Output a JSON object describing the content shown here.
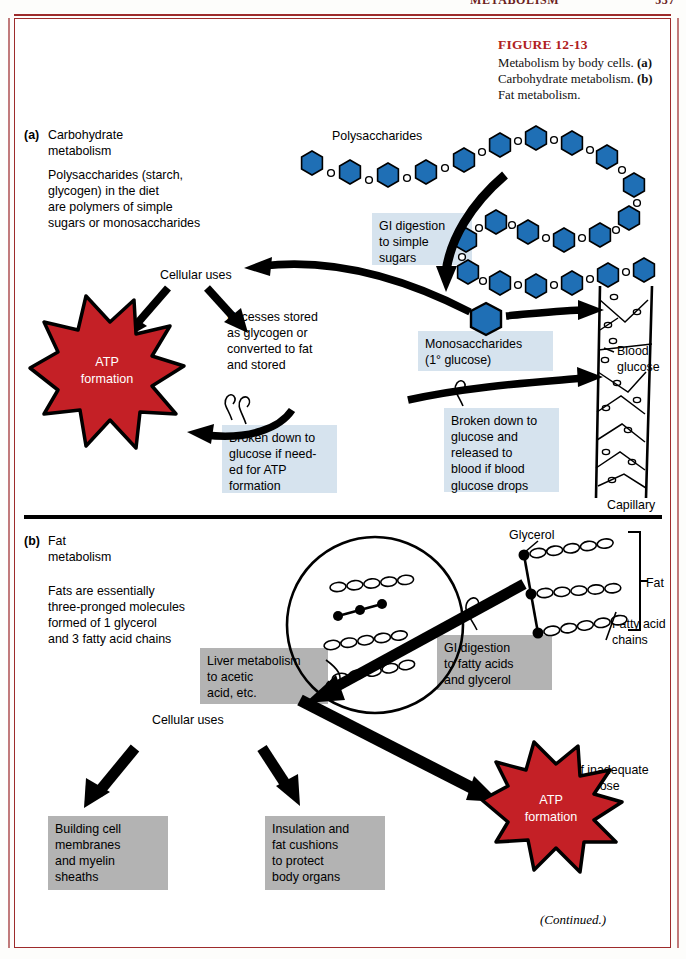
{
  "page": {
    "running_head_left": "METABOLISM",
    "running_head_right": "537",
    "continued_note": "(Continued.)"
  },
  "caption": {
    "figure_number": "FIGURE 12-13",
    "line1": "Metabolism by body",
    "line2_pre": "cells. ",
    "label_a": "(a)",
    "line2_post": " Carbohydrate",
    "line3_pre": "metabolism. ",
    "label_b": "(b)",
    "line3_post": " Fat",
    "line4": "metabolism."
  },
  "panel_a": {
    "key": "(a)",
    "heading": "Carbohydrate\nmetabolism",
    "intro": "Polysaccharides (starch,\nglycogen) in the diet\nare polymers of simple\nsugars or monosaccharides",
    "polysaccharides_label": "Polysaccharides",
    "gi_digestion_box": "GI digestion\nto simple\nsugars",
    "monosaccharides_box": "Monosaccharides\n(1° glucose)",
    "cellular_uses": "Cellular uses",
    "excesses_stored": "Excesses stored\nas glycogen or\nconverted to fat\nand stored",
    "atp_star": "ATP\nformation",
    "broken_down_atp_box": "Broken down to\nglucose if need-\ned for ATP\nformation",
    "broken_down_blood_box": "Broken down to\nglucose and\nreleased to\nblood if blood\nglucose drops",
    "blood_glucose_label": "Blood\nglucose",
    "capillary_label": "Capillary"
  },
  "panel_b": {
    "key": "(b)",
    "heading": "Fat\nmetabolism",
    "intro": "Fats are essentially\nthree-pronged molecules\nformed of 1 glycerol\nand 3 fatty acid chains",
    "glycerol_label": "Glycerol",
    "fat_label": "Fat",
    "fatty_acid_chains_label": "Fatty acid\nchains",
    "gi_digestion_box": "GI digestion\nto fatty acids\nand glycerol",
    "liver_metabolism_box": "Liver metabolism\nto acetic\nacid, etc.",
    "cellular_uses": "Cellular uses",
    "building_cell_box": "Building cell\nmembranes\nand myelin\nsheaths",
    "insulation_box": "Insulation and\nfat cushions\nto protect\nbody organs",
    "if_inadequate_label": "If inadequate\nglucose",
    "atp_star": "ATP\nformation"
  },
  "colors": {
    "frame_red": "#9d2b2b",
    "caption_red": "#b02020",
    "star_red": "#c42026",
    "hexagon_blue": "#1f6fb5",
    "box_blue": "#d6e3ee",
    "box_gray": "#b3b3b3",
    "ink": "#000000"
  },
  "icons": {
    "polysaccharide_chain": "hexagon-chain-icon",
    "monosaccharide": "hexagon-icon",
    "capillary": "capillary-vessel-icon",
    "fat_molecule": "triglyceride-icon",
    "digested_fat_cell": "cell-circle-icon",
    "atp_burst": "star-burst-icon"
  }
}
